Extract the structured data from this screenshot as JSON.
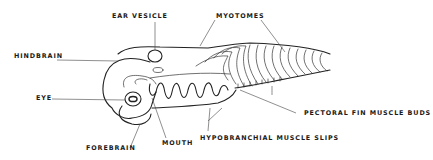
{
  "diagram": {
    "labels": {
      "ear_vesicle": "EAR VESICLE",
      "myotomes": "MYOTOMES",
      "hindbrain": "HINDBRAIN",
      "eye": "EYE",
      "pectoral_fin_muscle_buds": "PECTORAL FIN MUSCLE BUDS",
      "hypobranchial_muscle_slips": "HYPOBRANCHIAL MUSCLE SLIPS",
      "mouth": "MOUTH",
      "forebrain": "FOREBRAIN"
    }
  }
}
